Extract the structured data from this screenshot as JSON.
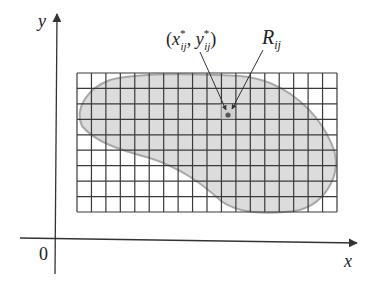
{
  "figure": {
    "type": "diagram",
    "colors": {
      "background": "#ffffff",
      "axis": "#333333",
      "grid": "#3a3a3a",
      "region_fill": "#dcdcdc",
      "region_edge": "#a8a8a8",
      "text": "#222222",
      "sample_point": "#555555"
    },
    "axes": {
      "x_label": "x",
      "y_label": "y",
      "origin_label": "0"
    },
    "grid": {
      "columns": 18,
      "rows": 9,
      "left": 77,
      "top": 73,
      "right": 337,
      "bottom": 212
    },
    "labels": {
      "sample_point": {
        "open": "(",
        "x": "x",
        "x_sup": "*",
        "x_sub": "ij",
        "comma": ", ",
        "y": "y",
        "y_sup": "*",
        "y_sub": "ij",
        "close": ")"
      },
      "subrectangle": {
        "main": "R",
        "sub": "ij"
      }
    }
  }
}
